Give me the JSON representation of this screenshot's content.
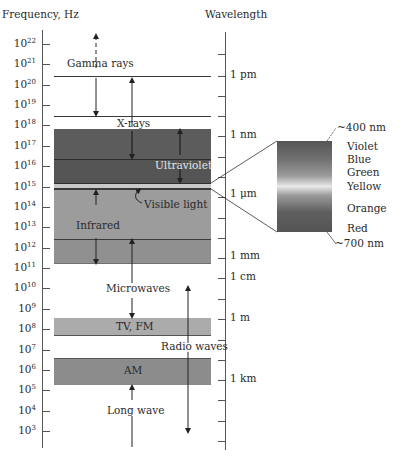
{
  "headers": {
    "frequency": "Frequency, Hz",
    "wavelength": "Wavelength"
  },
  "frequency_ticks": [
    {
      "base": "10",
      "exp": "22"
    },
    {
      "base": "10",
      "exp": "21"
    },
    {
      "base": "10",
      "exp": "20"
    },
    {
      "base": "10",
      "exp": "19"
    },
    {
      "base": "10",
      "exp": "18"
    },
    {
      "base": "10",
      "exp": "17"
    },
    {
      "base": "10",
      "exp": "16"
    },
    {
      "base": "10",
      "exp": "15"
    },
    {
      "base": "10",
      "exp": "14"
    },
    {
      "base": "10",
      "exp": "13"
    },
    {
      "base": "10",
      "exp": "12"
    },
    {
      "base": "10",
      "exp": "11"
    },
    {
      "base": "10",
      "exp": "10"
    },
    {
      "base": "10",
      "exp": "9"
    },
    {
      "base": "10",
      "exp": "8"
    },
    {
      "base": "10",
      "exp": "7"
    },
    {
      "base": "10",
      "exp": "6"
    },
    {
      "base": "10",
      "exp": "5"
    },
    {
      "base": "10",
      "exp": "4"
    },
    {
      "base": "10",
      "exp": "3"
    }
  ],
  "wavelength_labels": {
    "pm": "1 pm",
    "nm": "1 nm",
    "um": "1 μm",
    "mm": "1 mm",
    "cm": "1 cm",
    "m": "1 m",
    "km": "1 km"
  },
  "regions": {
    "gamma": "Gamma rays",
    "xray": "X-rays",
    "uv": "Ultraviolet",
    "visible": "Visible light",
    "ir": "Infrared",
    "microwave": "Microwaves",
    "tvfm": "TV, FM",
    "radio": "Radio waves",
    "am": "AM",
    "longwave": "Long wave"
  },
  "visible_spectrum": {
    "top_label": "~400 nm",
    "bottom_label": "~700 nm",
    "colors": [
      "Violet",
      "Blue",
      "Green",
      "Yellow",
      "Orange",
      "Red"
    ]
  },
  "colors": {
    "dark_band": "#5a5a5a",
    "uv_band": "#555555",
    "ir_band": "#9a9a9a",
    "ir_lower_band": "#8e8e8e",
    "tvfm_band": "#a8a8a8",
    "am_band": "#8a8a8a",
    "axis": "#555555"
  }
}
